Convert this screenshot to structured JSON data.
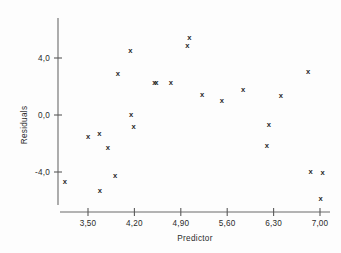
{
  "chart_data": {
    "type": "scatter",
    "title": "",
    "xlabel": "Predictor",
    "ylabel": "Residuals",
    "grid": false,
    "legend": null,
    "marker": "x",
    "xlim": [
      3.06,
      7.18
    ],
    "ylim": [
      -6.9,
      6.0
    ],
    "xticks": [
      3.5,
      4.2,
      4.9,
      5.6,
      6.3,
      7.0
    ],
    "xtick_labels": [
      "3,50",
      "4,20",
      "4,90",
      "5,60",
      "6,30",
      "7,00"
    ],
    "yticks": [
      4.0,
      0.0,
      -4.0
    ],
    "ytick_labels": [
      "4,0",
      "0,0",
      "-4,0"
    ],
    "points": [
      {
        "x": 3.15,
        "y": -4.63
      },
      {
        "x": 3.5,
        "y": -1.47
      },
      {
        "x": 3.68,
        "y": -5.26
      },
      {
        "x": 3.67,
        "y": -1.26
      },
      {
        "x": 3.8,
        "y": -2.25
      },
      {
        "x": 3.95,
        "y": 2.95
      },
      {
        "x": 3.91,
        "y": -4.21
      },
      {
        "x": 4.15,
        "y": 0.07
      },
      {
        "x": 4.14,
        "y": 4.56
      },
      {
        "x": 4.19,
        "y": -0.77
      },
      {
        "x": 4.5,
        "y": 2.32
      },
      {
        "x": 4.53,
        "y": 2.32
      },
      {
        "x": 4.75,
        "y": 2.32
      },
      {
        "x": 5.0,
        "y": 4.91
      },
      {
        "x": 5.03,
        "y": 5.49
      },
      {
        "x": 5.22,
        "y": 1.47
      },
      {
        "x": 5.52,
        "y": 1.05
      },
      {
        "x": 5.84,
        "y": 1.82
      },
      {
        "x": 6.23,
        "y": -0.63
      },
      {
        "x": 6.2,
        "y": -2.11
      },
      {
        "x": 6.41,
        "y": 1.4
      },
      {
        "x": 6.82,
        "y": 3.09
      },
      {
        "x": 6.86,
        "y": -3.93
      },
      {
        "x": 7.04,
        "y": -4.0
      },
      {
        "x": 7.01,
        "y": -5.82
      }
    ]
  },
  "colors": {
    "axis": "#6b6b6b",
    "text": "#2b2b2b",
    "marker": "#2a2a2a",
    "background": "#fdfdfd"
  }
}
